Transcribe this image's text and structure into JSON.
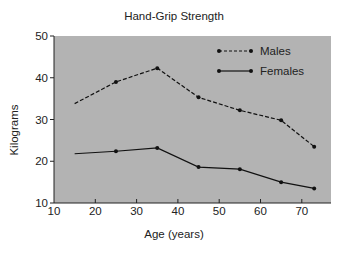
{
  "chart_data": {
    "type": "line",
    "title": "Hand-Grip Strength",
    "xlabel": "Age (years)",
    "ylabel": "Kilograms",
    "xlim": [
      10,
      77
    ],
    "ylim": [
      10,
      50
    ],
    "x_ticks": [
      10,
      20,
      30,
      40,
      50,
      60,
      70
    ],
    "y_ticks": [
      10,
      20,
      30,
      40,
      50
    ],
    "grid": false,
    "legend_position": "upper right (inside plot)",
    "plot_background": "#b3b3b3",
    "series": [
      {
        "name": "Males",
        "line_style": "dashed",
        "marker": "dot",
        "x": [
          15,
          25,
          35,
          45,
          55,
          65,
          73
        ],
        "values": [
          33.8,
          39.0,
          42.3,
          35.3,
          32.2,
          29.8,
          23.5
        ]
      },
      {
        "name": "Females",
        "line_style": "solid",
        "marker": "dot",
        "x": [
          15,
          25,
          35,
          45,
          55,
          65,
          73
        ],
        "values": [
          21.8,
          22.4,
          23.2,
          18.6,
          18.1,
          15.0,
          13.5
        ]
      }
    ]
  }
}
